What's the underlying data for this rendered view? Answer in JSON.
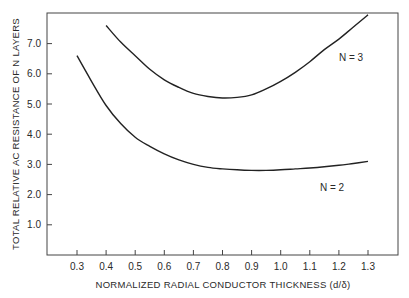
{
  "chart_data": {
    "type": "line",
    "title": "",
    "xlabel": "NORMALIZED RADIAL CONDUCTOR THICKNESS (d/δ)",
    "ylabel": "TOTAL RELATIVE AC RESISTANCE OF N LAYERS",
    "xlim": [
      0.2,
      1.4
    ],
    "ylim": [
      0,
      8.0
    ],
    "grid": false,
    "legend": "inline labels",
    "x_ticks": [
      "0.3",
      "0.4",
      "0.5",
      "0.6",
      "0.7",
      "0.8",
      "0.9",
      "1.0",
      "1.1",
      "1.2",
      "1.3"
    ],
    "y_ticks": [
      "1.0",
      "2.0",
      "3.0",
      "4.0",
      "5.0",
      "6.0",
      "7.0"
    ],
    "series": [
      {
        "name": "N = 3",
        "x": [
          0.4,
          0.45,
          0.5,
          0.55,
          0.6,
          0.65,
          0.7,
          0.75,
          0.8,
          0.85,
          0.9,
          0.95,
          1.0,
          1.05,
          1.1,
          1.15,
          1.2,
          1.25,
          1.3
        ],
        "values": [
          7.6,
          7.05,
          6.6,
          6.15,
          5.8,
          5.55,
          5.35,
          5.25,
          5.2,
          5.22,
          5.3,
          5.5,
          5.75,
          6.05,
          6.4,
          6.8,
          7.15,
          7.55,
          7.95
        ]
      },
      {
        "name": "N = 2",
        "x": [
          0.3,
          0.35,
          0.4,
          0.45,
          0.5,
          0.55,
          0.6,
          0.65,
          0.7,
          0.75,
          0.8,
          0.85,
          0.9,
          0.95,
          1.0,
          1.05,
          1.1,
          1.15,
          1.2,
          1.25,
          1.3
        ],
        "values": [
          6.6,
          5.75,
          4.95,
          4.35,
          3.9,
          3.6,
          3.35,
          3.15,
          3.0,
          2.9,
          2.85,
          2.82,
          2.8,
          2.8,
          2.82,
          2.85,
          2.88,
          2.92,
          2.97,
          3.03,
          3.1
        ]
      }
    ],
    "annotations": [
      {
        "text": "N = 3",
        "x": 1.27,
        "y": 6.75
      },
      {
        "text": "N = 2",
        "x": 1.22,
        "y": 2.1
      }
    ]
  },
  "labels": {
    "n3": "N = 3",
    "n2": "N = 2"
  }
}
